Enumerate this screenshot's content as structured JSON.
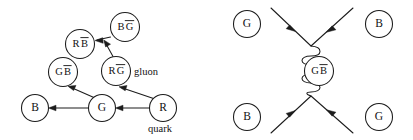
{
  "figure": {
    "type": "diagram",
    "background_color": "#ffffff",
    "line_color": "#1c1c1c",
    "text_color": "#111111"
  },
  "left_diagram": {
    "name": "colour-flow-tree",
    "nodes": [
      {
        "id": "r",
        "label": "R",
        "bar": "",
        "cx": 163,
        "cy": 108,
        "r": 13.5
      },
      {
        "id": "g",
        "label": "G",
        "bar": "",
        "cx": 102,
        "cy": 108,
        "r": 13.5
      },
      {
        "id": "b",
        "label": "B",
        "bar": "",
        "cx": 35,
        "cy": 108,
        "r": 13.5
      },
      {
        "id": "rgb",
        "label": "R",
        "bar": "G",
        "cx": 116,
        "cy": 71,
        "r": 14.5
      },
      {
        "id": "gbb",
        "label": "G",
        "bar": "B",
        "cx": 63,
        "cy": 72,
        "r": 14.5
      },
      {
        "id": "bgb",
        "label": "B",
        "bar": "G",
        "cx": 125,
        "cy": 27,
        "r": 14.5
      },
      {
        "id": "rbb",
        "label": "R",
        "bar": "B",
        "cx": 80,
        "cy": 44,
        "r": 14.5
      }
    ],
    "annotations": [
      {
        "id": "gluon-label",
        "text": "gluon",
        "x": 134,
        "y": 75
      },
      {
        "id": "quark-label",
        "text": "quark",
        "x": 148,
        "y": 132
      }
    ],
    "edges": [
      {
        "id": "r-to-g",
        "from": "R",
        "to": "G",
        "direction": "leftward"
      },
      {
        "id": "g-to-b",
        "from": "G",
        "to": "B",
        "direction": "leftward"
      },
      {
        "id": "r-to-rg",
        "from": "R",
        "to": "RG",
        "direction": "upward"
      },
      {
        "id": "g-to-gb",
        "from": "G",
        "to": "GB",
        "direction": "upward"
      },
      {
        "id": "rg-to-bg",
        "from": "RG",
        "to": "BG",
        "direction": "upward"
      },
      {
        "id": "bg-to-rb",
        "from": "BG",
        "to": "RB",
        "direction": "leftward"
      }
    ]
  },
  "right_diagram": {
    "name": "gluon-exchange-feynman",
    "nodes": [
      {
        "id": "tl",
        "label": "G",
        "bar": "",
        "cx": 40,
        "cy": 24,
        "r": 13.5
      },
      {
        "id": "tr",
        "label": "B",
        "bar": "",
        "cx": 172,
        "cy": 24,
        "r": 13.5
      },
      {
        "id": "bl",
        "label": "B",
        "bar": "",
        "cx": 40,
        "cy": 117,
        "r": 13.5
      },
      {
        "id": "br",
        "label": "G",
        "bar": "",
        "cx": 172,
        "cy": 117,
        "r": 13.5
      },
      {
        "id": "mid",
        "label": "G",
        "bar": "B",
        "cx": 112,
        "cy": 71,
        "r": 14.5
      }
    ],
    "vertices": [
      {
        "id": "top-vertex",
        "x": 104,
        "y": 46
      },
      {
        "id": "bottom-vertex",
        "x": 104,
        "y": 96
      }
    ],
    "legs": [
      {
        "id": "leg-top-left",
        "from": "top-vertex",
        "to": "upper-left",
        "arrow": "inward"
      },
      {
        "id": "leg-top-right",
        "from": "top-vertex",
        "to": "upper-right",
        "arrow": "inward"
      },
      {
        "id": "leg-bottom-left",
        "from": "bottom-vertex",
        "to": "lower-left",
        "arrow": "inward"
      },
      {
        "id": "leg-bottom-right",
        "from": "bottom-vertex",
        "to": "lower-right",
        "arrow": "inward"
      }
    ],
    "propagator": {
      "id": "gluon-propagator",
      "style": "coil",
      "loops": 5,
      "x": 104,
      "y_top": 46,
      "y_bottom": 96
    }
  }
}
